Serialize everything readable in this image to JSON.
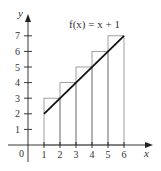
{
  "chart_data": {
    "type": "bar",
    "title": "",
    "xlabel": "x",
    "ylabel": "y",
    "function_label": "f(x) = x + 1",
    "categories": [
      1,
      2,
      3,
      4,
      5
    ],
    "rectangles": [
      {
        "x_left": 1,
        "x_right": 2,
        "height": 3
      },
      {
        "x_left": 2,
        "x_right": 3,
        "height": 4
      },
      {
        "x_left": 3,
        "x_right": 4,
        "height": 5
      },
      {
        "x_left": 4,
        "x_right": 5,
        "height": 6
      },
      {
        "x_left": 5,
        "x_right": 6,
        "height": 7
      }
    ],
    "line": {
      "x": [
        1,
        6
      ],
      "y": [
        2,
        7
      ]
    },
    "xticks": [
      "1",
      "2",
      "3",
      "4",
      "5",
      "6"
    ],
    "yticks": [
      "1",
      "2",
      "3",
      "4",
      "5",
      "6",
      "7"
    ],
    "origin_label": "0",
    "xlim": [
      0,
      7
    ],
    "ylim": [
      0,
      8
    ],
    "grid": false,
    "legend": "none"
  }
}
